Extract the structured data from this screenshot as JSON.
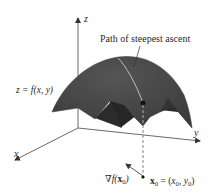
{
  "figure": {
    "colors": {
      "surface_top": "#4a4a4a",
      "surface_under": "#2f2f2f",
      "surface_edge": "#555555",
      "axis": "#6a6a6a",
      "path": "#c8c8c8",
      "dashed": "#9a9a9a",
      "point": "#111111",
      "text": "#2a2a2a"
    },
    "labels": {
      "z_axis": "z",
      "y_axis": "y",
      "x_axis": "x",
      "path_caption": "Path of steepest ascent",
      "surface_eq": "z = f(x, y)",
      "gradient_nabla": "∇",
      "gradient_f": "f(",
      "gradient_x": "x",
      "gradient_sub": "0",
      "gradient_close": ")",
      "point_x": "x",
      "point_sub": "0",
      "point_eq": " = (",
      "point_x0": "x",
      "point_x0_sub": "0",
      "point_comma": ", ",
      "point_y0": "y",
      "point_y0_sub": "0",
      "point_close": ")"
    }
  }
}
